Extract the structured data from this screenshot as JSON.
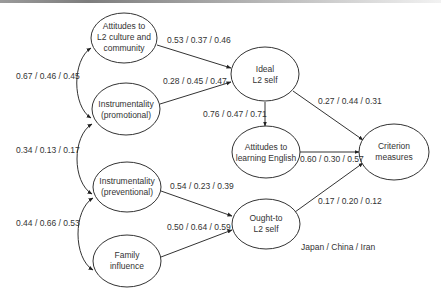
{
  "diagram": {
    "type": "structural-equation-model",
    "nodes": {
      "attitudes_l2_culture": {
        "lines": [
          "Attitudes to",
          "L2 culture and",
          "community"
        ]
      },
      "instr_promotional": {
        "lines": [
          "Instrumentality",
          "(promotional)"
        ]
      },
      "instr_preventional": {
        "lines": [
          "Instrumentality",
          "(preventional)"
        ]
      },
      "family_influence": {
        "lines": [
          "Family",
          "influence"
        ]
      },
      "ideal_l2_self": {
        "lines": [
          "Ideal",
          "L2 self"
        ]
      },
      "attitudes_learning_english": {
        "lines": [
          "Attitudes to",
          "learning English"
        ]
      },
      "ought_to_l2_self": {
        "lines": [
          "Ought-to",
          "L2 self"
        ]
      },
      "criterion_measures": {
        "lines": [
          "Criterion",
          "measures"
        ]
      }
    },
    "edges": {
      "culture_to_ideal": "0.53  / 0.37  / 0.46",
      "promotional_to_ideal": "0.28  / 0.45  / 0.47",
      "ideal_to_attitudes_english": "0.76  / 0.47  / 0.71",
      "ideal_to_criterion": "0.27  / 0.44  / 0.31",
      "attitudes_english_to_criterion": "0.60  / 0.30  / 0.57",
      "preventional_to_ought": "0.54  / 0.23  / 0.39",
      "family_to_ought": "0.50  / 0.64  / 0.59",
      "ought_to_criterion": "0.17  / 0.20  / 0.12",
      "corr_culture_promotional": "0.67  / 0.46  / 0.45",
      "corr_promotional_preventional": "0.34  / 0.13  / 0.17",
      "corr_preventional_family": "0.44  / 0.66  / 0.53"
    },
    "legend": "Japan  /  China /  Iran"
  }
}
